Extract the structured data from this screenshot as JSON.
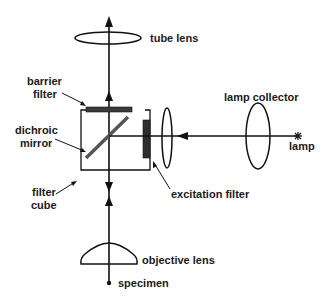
{
  "colors": {
    "line": "#111111",
    "filter": "#3a3a3a",
    "mirror": "#555555",
    "background": "#ffffff"
  },
  "labels": {
    "tube_lens": "tube lens",
    "barrier_filter_1": "barrier",
    "barrier_filter_2": "filter",
    "dichroic_mirror_1": "dichroic",
    "dichroic_mirror_2": "mirror",
    "filter_cube_1": "filter",
    "filter_cube_2": "cube",
    "lamp_collector": "lamp collector",
    "lamp": "lamp",
    "excitation_filter": "excitation filter",
    "objective_lens": "objective lens",
    "specimen": "specimen"
  },
  "components": [
    {
      "id": "tube-lens",
      "label": "tube lens"
    },
    {
      "id": "barrier-filter",
      "label": "barrier filter"
    },
    {
      "id": "dichroic-mirror",
      "label": "dichroic mirror"
    },
    {
      "id": "filter-cube",
      "label": "filter cube"
    },
    {
      "id": "excitation-filter",
      "label": "excitation filter"
    },
    {
      "id": "lamp-collector",
      "label": "lamp collector"
    },
    {
      "id": "lamp",
      "label": "lamp"
    },
    {
      "id": "objective-lens",
      "label": "objective lens"
    },
    {
      "id": "specimen",
      "label": "specimen"
    }
  ]
}
